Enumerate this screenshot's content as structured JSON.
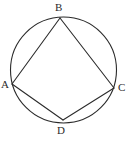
{
  "figure": {
    "type": "geometry-diagram",
    "background_color": "#ffffff",
    "stroke_color": "#2b2b2b",
    "stroke_width": 1.1,
    "canvas": {
      "width": 130,
      "height": 141
    },
    "circle": {
      "name": "circumscribed-circle",
      "cx": 63.5,
      "cy": 70,
      "r": 53
    },
    "vertices": [
      {
        "id": "A",
        "label": "A",
        "x": 12,
        "y": 84,
        "label_x": 1,
        "label_y": 79
      },
      {
        "id": "B",
        "label": "B",
        "x": 60,
        "y": 18,
        "label_x": 55,
        "label_y": 2
      },
      {
        "id": "C",
        "label": "C",
        "x": 114,
        "y": 88,
        "label_x": 118,
        "label_y": 82
      },
      {
        "id": "D",
        "label": "D",
        "x": 63,
        "y": 120,
        "label_x": 57,
        "label_y": 125
      }
    ],
    "edges": [
      {
        "id": "AB",
        "from": "A",
        "to": "B"
      },
      {
        "id": "BC",
        "from": "B",
        "to": "C"
      },
      {
        "id": "CD",
        "from": "C",
        "to": "D"
      },
      {
        "id": "DA",
        "from": "D",
        "to": "A"
      }
    ]
  }
}
